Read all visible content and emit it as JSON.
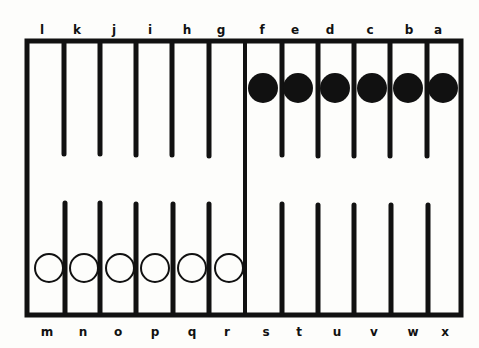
{
  "board": {
    "top_labels": [
      "l",
      "k",
      "j",
      "i",
      "h",
      "g",
      "f",
      "e",
      "d",
      "c",
      "b",
      "a"
    ],
    "bottom_labels": [
      "m",
      "n",
      "o",
      "p",
      "q",
      "r",
      "s",
      "t",
      "u",
      "v",
      "w",
      "x"
    ],
    "colors": {
      "ink": "#111111",
      "paper": "#fdfdfb"
    }
  },
  "pieces": {
    "black": {
      "points": [
        "f",
        "e",
        "d",
        "c",
        "b",
        "a"
      ],
      "style": "filled"
    },
    "white": {
      "points": [
        "m",
        "n",
        "o",
        "p",
        "q",
        "r"
      ],
      "style": "hollow"
    }
  }
}
